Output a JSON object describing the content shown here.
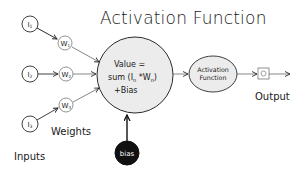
{
  "title": "Activation Function",
  "inputs": {
    "label": "Inputs",
    "nodes": [
      {
        "id": "I1",
        "label": "I",
        "sub": "1"
      },
      {
        "id": "I2",
        "label": "I",
        "sub": "2"
      },
      {
        "id": "I3",
        "label": "I",
        "sub": "3"
      }
    ]
  },
  "weights": {
    "label": "Weights",
    "nodes": [
      {
        "id": "W1",
        "label": "W",
        "sub": "1"
      },
      {
        "id": "W2",
        "label": "W",
        "sub": "2"
      },
      {
        "id": "W3",
        "label": "W",
        "sub": "3"
      }
    ]
  },
  "summation": {
    "line1": "Value =",
    "line2": "sum (I",
    "line2_sub": "n",
    "line2_mid": " *W",
    "line2_sub2": "n",
    "line2_end": ")",
    "line3": "+Bias"
  },
  "bias": {
    "label": "bias"
  },
  "activation": {
    "line1": "Activation",
    "line2": "Function"
  },
  "output": {
    "label": "Output"
  },
  "colors": {
    "stroke": "#2b2b2b",
    "main_fill": "#ececec",
    "bias_fill": "#111111",
    "background": "#ffffff"
  }
}
